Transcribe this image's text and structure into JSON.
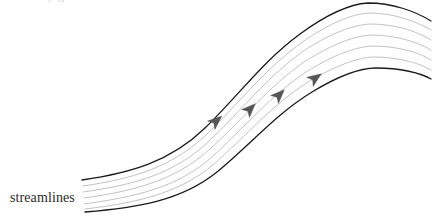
{
  "figure": {
    "kind": "streamline-flow-diagram",
    "caption_label": "streamlines",
    "background_color": "#ffffff",
    "width": 438,
    "height": 219,
    "top_crop_remnant_text": "y g",
    "boundary_color": "#1a1a1a",
    "boundary_width": 1.3,
    "streamline_color": "#a8a8a8",
    "streamline_width": 0.7,
    "arrow_color": "#555555",
    "arrow_count": 4,
    "inner_streamline_count": 5,
    "boundary_count": 2
  },
  "chart_data": {
    "type": "line",
    "title": "streamlines",
    "xlabel": "",
    "ylabel": "",
    "xlim": [
      82,
      431
    ],
    "ylim": [
      219,
      0
    ],
    "grid": false,
    "legend": "none",
    "annotations": [
      {
        "text": "streamlines",
        "x": 10,
        "y": 199,
        "role": "label"
      }
    ],
    "series": [
      {
        "name": "upper-boundary",
        "role": "boundary",
        "color": "#1a1a1a",
        "width": 1.3,
        "path": "M 82,180 C 130,173 170,162 205,128 C 240,94 262,62 300,34 C 330,12 352,4 368,3 C 392,3 415,11 431,21"
      },
      {
        "name": "streamline-1",
        "role": "inner",
        "color": "#a8a8a8",
        "width": 0.7,
        "path": "M 83,186 C 131,179 171,168 206,135 C 241,101 264,70 301,43 C 331,22 353,14 369,13 C 393,13 416,21 431,30"
      },
      {
        "name": "streamline-2",
        "role": "inner",
        "color": "#a8a8a8",
        "width": 0.7,
        "path": "M 83,192 C 132,185 173,175 208,142 C 243,109 266,78 302,52 C 332,32 354,25 370,24 C 394,24 417,31 431,40"
      },
      {
        "name": "streamline-3",
        "role": "inner",
        "color": "#a8a8a8",
        "width": 0.7,
        "path": "M 84,198 C 133,191 175,181 210,149 C 245,117 268,87 304,62 C 334,43 355,36 371,35 C 395,35 418,42 431,50"
      },
      {
        "name": "streamline-4",
        "role": "inner",
        "color": "#a8a8a8",
        "width": 0.7,
        "path": "M 84,204 C 134,197 177,188 212,157 C 247,125 270,96 306,72 C 335,54 356,47 372,46 C 396,46 419,52 431,60"
      },
      {
        "name": "streamline-5",
        "role": "inner",
        "color": "#a8a8a8",
        "width": 0.7,
        "path": "M 85,209 C 135,203 179,194 214,164 C 249,133 272,105 308,82 C 337,65 357,58 373,57 C 397,57 420,63 431,70"
      },
      {
        "name": "lower-boundary",
        "role": "boundary",
        "color": "#1a1a1a",
        "width": 1.3,
        "path": "M 85,212 C 136,208 181,201 217,172 C 252,143 276,114 312,92 C 340,75 360,68 376,68 C 400,68 421,73 431,79"
      }
    ],
    "arrows": [
      {
        "name": "arrow-1",
        "x": 215,
        "y": 122,
        "angle": -41,
        "size": 9
      },
      {
        "name": "arrow-2",
        "x": 249,
        "y": 110,
        "angle": -45,
        "size": 9
      },
      {
        "name": "arrow-3",
        "x": 278,
        "y": 96,
        "angle": -45,
        "size": 9
      },
      {
        "name": "arrow-4",
        "x": 314,
        "y": 79,
        "angle": -35,
        "size": 9
      }
    ]
  }
}
